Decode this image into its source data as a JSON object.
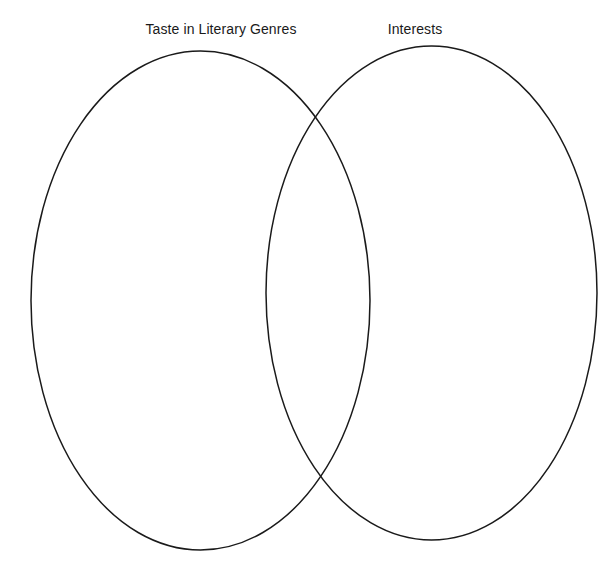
{
  "diagram": {
    "type": "venn",
    "background_color": "#ffffff",
    "stroke_color": "#1a1a1a",
    "text_color": "#1a1a1a",
    "sets": [
      {
        "id": "left",
        "label": "Taste in Literary Genres",
        "contents": [],
        "shape": "ellipse",
        "center_x": 200.5,
        "center_y": 300.5,
        "radius_x": 169.5,
        "radius_y": 249.5
      },
      {
        "id": "right",
        "label": "Interests",
        "contents": [],
        "shape": "ellipse",
        "center_x": 431.5,
        "center_y": 293.0,
        "radius_x": 165.5,
        "radius_y": 247.0
      }
    ],
    "intersection": {
      "label": "",
      "contents": []
    }
  }
}
